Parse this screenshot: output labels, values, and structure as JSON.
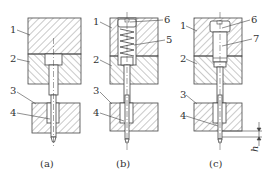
{
  "diagram": {
    "type": "mechanical cross-section",
    "colors": {
      "line": "#444444",
      "hatch": "#777777",
      "background": "#ffffff"
    },
    "panels": [
      {
        "id": "a",
        "caption": "(a)",
        "labels": [
          {
            "num": "1",
            "part": "upper plate"
          },
          {
            "num": "2",
            "part": "punch holder plate"
          },
          {
            "num": "3",
            "part": "stripper plate"
          },
          {
            "num": "4",
            "part": "pilot pin"
          }
        ]
      },
      {
        "id": "b",
        "caption": "(b)",
        "labels": [
          {
            "num": "1",
            "part": "upper plate"
          },
          {
            "num": "2",
            "part": "punch holder plate"
          },
          {
            "num": "3",
            "part": "stripper plate"
          },
          {
            "num": "4",
            "part": "pilot pin"
          },
          {
            "num": "5",
            "part": "spring"
          },
          {
            "num": "6",
            "part": "screw plug"
          }
        ]
      },
      {
        "id": "c",
        "caption": "(c)",
        "labels": [
          {
            "num": "1",
            "part": "upper plate"
          },
          {
            "num": "2",
            "part": "punch holder plate"
          },
          {
            "num": "3",
            "part": "stripper plate"
          },
          {
            "num": "4",
            "part": "pilot pin"
          },
          {
            "num": "6",
            "part": "screw plug"
          },
          {
            "num": "7",
            "part": "sleeve"
          }
        ],
        "dimension": "h"
      }
    ]
  }
}
